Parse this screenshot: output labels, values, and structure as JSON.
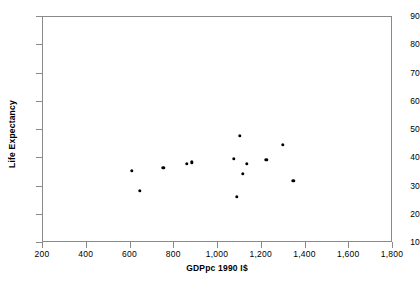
{
  "chart_data": {
    "type": "scatter",
    "title": "",
    "xlabel": "GDPpc 1990 I$",
    "ylabel": "Life Expectancy",
    "xlim": [
      200,
      1800
    ],
    "ylim": [
      10,
      90
    ],
    "xticks": [
      200,
      400,
      600,
      800,
      1000,
      1200,
      1400,
      1600,
      1800
    ],
    "xtick_labels": [
      "200",
      "400",
      "600",
      "800",
      "1,000",
      "1,200",
      "1,400",
      "1,600",
      "1,800"
    ],
    "yticks": [
      10,
      20,
      30,
      40,
      50,
      60,
      70,
      80,
      90
    ],
    "ytick_labels": [
      "10",
      "20",
      "30",
      "40",
      "50",
      "60",
      "70",
      "80",
      "90"
    ],
    "grid": false,
    "legend": false,
    "marker": "filled-circle",
    "marker_color": "#000000",
    "frame_color": "#8a8a8a",
    "points": [
      {
        "x": 611,
        "y": 35.2
      },
      {
        "x": 648,
        "y": 28.2
      },
      {
        "x": 755,
        "y": 36.3
      },
      {
        "x": 862,
        "y": 37.6
      },
      {
        "x": 885,
        "y": 38.2
      },
      {
        "x": 1077,
        "y": 39.4
      },
      {
        "x": 1090,
        "y": 26.0
      },
      {
        "x": 1105,
        "y": 47.5
      },
      {
        "x": 1117,
        "y": 34.1
      },
      {
        "x": 1137,
        "y": 37.6
      },
      {
        "x": 1225,
        "y": 39.0
      },
      {
        "x": 1302,
        "y": 44.3
      },
      {
        "x": 1348,
        "y": 31.6
      }
    ]
  }
}
